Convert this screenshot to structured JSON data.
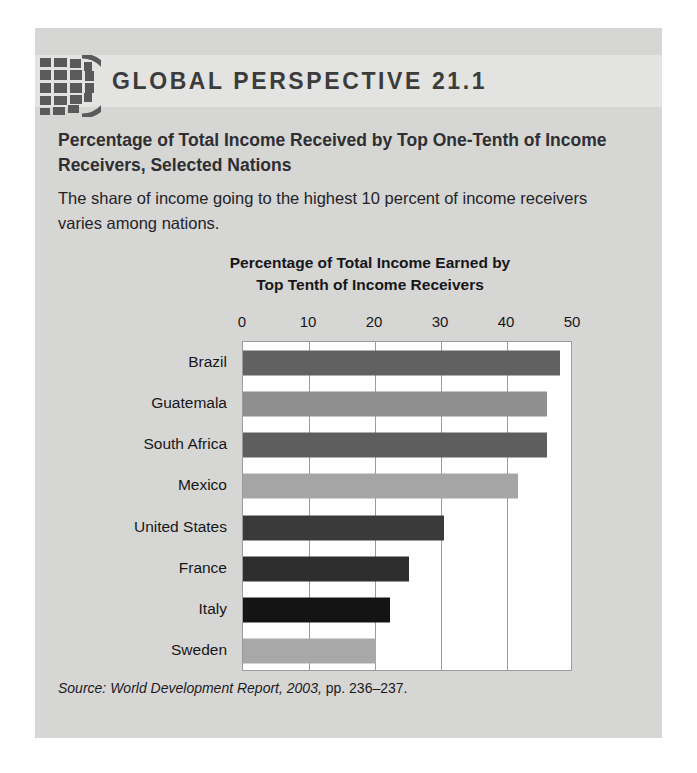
{
  "header": {
    "title": "GLOBAL PERSPECTIVE 21.1",
    "icon": "globe-icon"
  },
  "subtitle": "Percentage of Total Income Received by Top One-Tenth of Income Receivers, Selected Nations",
  "body_text": "The share of income going to the highest 10 percent of income receivers varies among nations.",
  "source": {
    "prefix": "Source:",
    "text": "World Development Report, 2003,",
    "pages": "pp. 236–237."
  },
  "colors": {
    "panel": "#d6d6d4",
    "header_band": "#e3e3e1",
    "plot_bg": "#ffffff",
    "grid": "#9b9b9b",
    "text": "#17171a"
  },
  "chart_data": {
    "type": "bar",
    "orientation": "horizontal",
    "title": "Percentage of Total Income Earned by Top Tenth of Income Receivers",
    "title_line1": "Percentage of Total Income Earned by",
    "title_line2": "Top Tenth of Income Receivers",
    "xlabel": "",
    "ylabel": "",
    "xlim": [
      0,
      50
    ],
    "ticks": [
      0,
      10,
      20,
      30,
      40,
      50
    ],
    "tick_labels": [
      "0",
      "10",
      "20",
      "30",
      "40",
      "50"
    ],
    "grid": true,
    "legend": "none",
    "categories": [
      "Brazil",
      "Guatemala",
      "South Africa",
      "Mexico",
      "United States",
      "France",
      "Italy",
      "Sweden"
    ],
    "values": [
      48.0,
      46.0,
      46.0,
      41.7,
      30.5,
      25.1,
      22.2,
      20.1
    ],
    "bar_colors": [
      "#616161",
      "#8f8f8f",
      "#5e5e5e",
      "#a5a5a5",
      "#3a3a3a",
      "#2e2e2e",
      "#141414",
      "#a8a8a8"
    ]
  }
}
